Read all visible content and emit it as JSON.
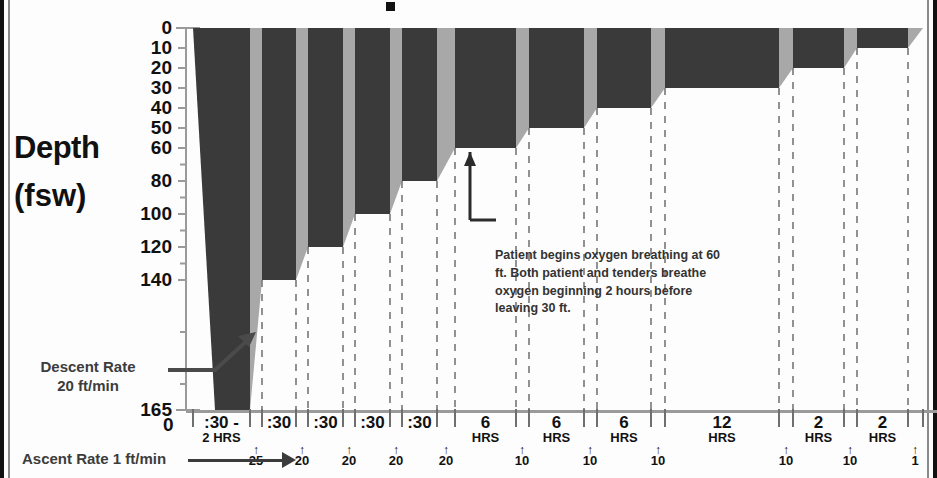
{
  "axis": {
    "y_title": "Depth",
    "y_unit": "(fsw)",
    "y_ticks": [
      0,
      10,
      20,
      30,
      40,
      50,
      60,
      80,
      100,
      120,
      140,
      165
    ],
    "x_origin_label": "0"
  },
  "notes": {
    "descent_rate_line1": "Descent Rate",
    "descent_rate_line2": "20 ft/min",
    "ascent_rate": "Ascent Rate 1 ft/min",
    "oxygen": "Patient begins oxygen breathing at 60 ft.  Both patient and tenders breathe oxygen beginning 2 hours before leaving 30 ft."
  },
  "chart_data": {
    "type": "area",
    "title": "",
    "xlabel": "",
    "ylabel": "Depth (fsw)",
    "ylim": [
      0,
      165
    ],
    "y_ticks": [
      0,
      10,
      20,
      30,
      40,
      50,
      60,
      80,
      100,
      120,
      140,
      165
    ],
    "grid": false,
    "legend": "none",
    "series_note": "Stepped decompression profile: dark blocks are depth holds, light grey wedges are ascents",
    "stops": [
      {
        "depth": 165,
        "duration_label": ":30 -",
        "duration_label2": "2 HRS"
      },
      {
        "depth": 140,
        "duration_label": ":30"
      },
      {
        "depth": 120,
        "duration_label": ":30"
      },
      {
        "depth": 100,
        "duration_label": ":30"
      },
      {
        "depth": 80,
        "duration_label": ":30"
      },
      {
        "depth": 60,
        "duration_label": "6",
        "duration_label2": "HRS"
      },
      {
        "depth": 50,
        "duration_label": "6",
        "duration_label2": "HRS"
      },
      {
        "depth": 40,
        "duration_label": "6",
        "duration_label2": "HRS"
      },
      {
        "depth": 30,
        "duration_label": "12",
        "duration_label2": "HRS"
      },
      {
        "depth": 20,
        "duration_label": "2",
        "duration_label2": "HRS"
      },
      {
        "depth": 10,
        "duration_label": "2",
        "duration_label2": "HRS"
      }
    ],
    "ascent_markers": [
      "25",
      "20",
      "20",
      "20",
      "20",
      "10",
      "10",
      "10",
      "10",
      "10",
      "1"
    ]
  }
}
